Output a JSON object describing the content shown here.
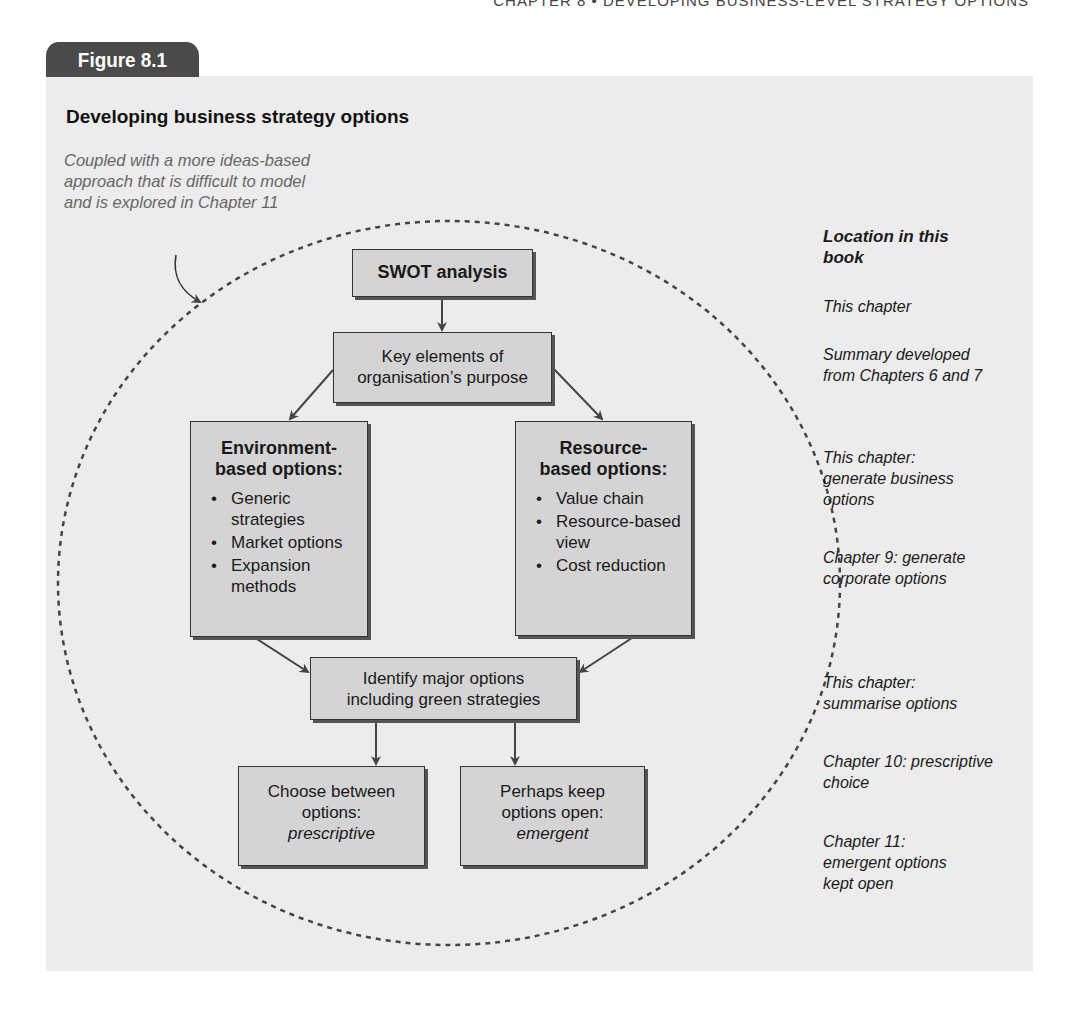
{
  "running_head": "CHAPTER 8 • DEVELOPING BUSINESS-LEVEL STRATEGY OPTIONS",
  "figure": {
    "label": "Figure 8.1",
    "title": "Developing business strategy options",
    "note": "Coupled with a more ideas-based approach that is difficult to model and is explored in Chapter 11"
  },
  "diagram": {
    "swot": "SWOT analysis",
    "key_elements": "Key elements of organisation’s purpose",
    "environment": {
      "heading": "Environment-based options:",
      "items": [
        "Generic strategies",
        "Market options",
        "Expansion methods"
      ]
    },
    "resource": {
      "heading": "Resource-based options:",
      "items": [
        "Value chain",
        "Resource-based view",
        "Cost reduction"
      ]
    },
    "identify": "Identify major options including green strategies",
    "choose": {
      "line": "Choose between options:",
      "emph": "prescriptive"
    },
    "perhaps": {
      "line": "Perhaps keep options open:",
      "emph": "emergent"
    }
  },
  "location": {
    "heading": "Location in this book",
    "entries": [
      "This chapter",
      "Summary developed from Chapters 6 and 7",
      "This chapter: generate business options",
      "Chapter 9: generate corporate options",
      "This chapter: summarise options",
      "Chapter 10: prescriptive choice",
      "Chapter 11: emergent options kept open"
    ]
  },
  "colors": {
    "panel_bg": "#ececec",
    "box_fill": "#d4d4d4",
    "tab_bg": "#4a4a4a",
    "note_text": "#666666"
  }
}
